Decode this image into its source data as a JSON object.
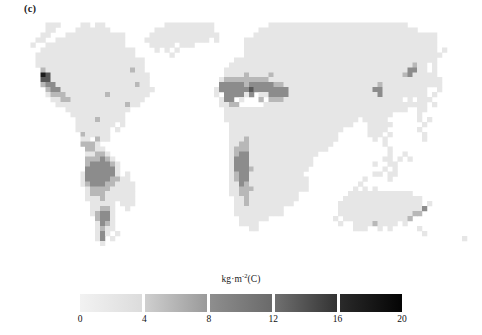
{
  "figure": {
    "panel_label": "(c)",
    "background_color": "#ffffff",
    "type": "global-gridded-map"
  },
  "legend": {
    "title_main": "kg·m",
    "title_exponent": "-2",
    "title_suffix": "(C)",
    "title_plain": "kg·m-2(C)",
    "ticks": [
      "0",
      "4",
      "8",
      "12",
      "16",
      "20"
    ],
    "segment_colors": [
      [
        "#f2f2f2",
        "#dcdcdc"
      ],
      [
        "#cfcfcf",
        "#9a9a9a"
      ],
      [
        "#8e8e8e",
        "#6a6a6a"
      ],
      [
        "#707070",
        "#333333"
      ],
      [
        "#2a2a2a",
        "#040404"
      ]
    ],
    "vmin": 0,
    "vmax": 20,
    "n_segments": 5
  },
  "chart_data": {
    "type": "heatmap",
    "title": "",
    "subtitle": "",
    "xlabel": "",
    "ylabel": "",
    "grid": false,
    "legend_position": "bottom",
    "colorbar_label": "kg·m-2(C)",
    "colorbar_ticks": [
      0,
      4,
      8,
      12,
      16,
      20
    ],
    "zmin": 0,
    "zmax": 20,
    "projection": "equirectangular",
    "x_range_deg": [
      -180,
      180
    ],
    "y_range_deg": [
      -60,
      84
    ],
    "ncols": 90,
    "nrows": 46,
    "colormap": "grayscale-reversed-5-step",
    "nodata_color": "#ffffff",
    "value_units": "kg m^-2 carbon",
    "row_latitudes": [
      84,
      81,
      78,
      75,
      72,
      69,
      66,
      63,
      60,
      57,
      54,
      51,
      48,
      45,
      42,
      39,
      36,
      33,
      30,
      27,
      24,
      21,
      18,
      15,
      12,
      9,
      6,
      3,
      0,
      -3,
      -6,
      -9,
      -12,
      -15,
      -18,
      -21,
      -24,
      -27,
      -30,
      -33,
      -36,
      -39,
      -42,
      -45,
      -48,
      -51
    ],
    "col_longitudes_start": -180,
    "col_longitude_step": 4,
    "legend_bins": [
      {
        "range": [
          0,
          4
        ],
        "label": "0-4"
      },
      {
        "range": [
          4,
          8
        ],
        "label": "4-8"
      },
      {
        "range": [
          8,
          12
        ],
        "label": "8-12"
      },
      {
        "range": [
          12,
          16
        ],
        "label": "12-16"
      },
      {
        "range": [
          16,
          20
        ],
        "label": "16-20"
      }
    ],
    "rows": [
      "..........................................................................................",
      "....111....11.11............1111111111...........1111111111111111111111111111.............",
      "....11....1111111.........111111111111.........11111111111111111111111111111111..........",
      "...11...111111111111.....11111111111111.......1111111111111111111111111111111111111......",
      "..11..11111111111111....1111111111111.1.....111111111111111111111111111111111111111......",
      ".1..1111111111111111.....11111.111..........111111111111111111111111111111111111111......",
      "...1111111111111111111....1.1.1.............111111111111111111111111111111111111111.1....",
      "..11111111111111111111.......1..............1111111111111111111111111111111111111111.....",
      "..1111111111111111111111..................11111111111111111111111111111111111111111......",
      "..1111111111111111111111.................1111111111111111111111111111111111111211.1......",
      "...211111111111111111211................11111111111111111111111111111111111113311.1......",
      "...5411111111111111111111...............1111211112111111111111111111111111112311111......",
      "...4411111111111111111111..............122222222211111111111111111111111111111111111.....",
      "...2331111111111111111211..............333332333332211111111111111111112111111111111.....",
      "....2331111111111111111111............1333333433333331111111111111111133111111111..1.....",
      "....122211111111211111111.............1.333313.1133331111111111111111113111111111.1......",
      ".....1122111111111111111...............133.1...2.222111111111111111111111111.1.111.......",
      "......11111111111111211................1122.....111111111111111111111111111111111.1......",
      "........1111111111111...................1111111111111111111111111111111111111..11........",
      ".........11111111111....................1111111111111111111111111111111111.....1.........",
      "..........1111211111....................111111111111111111111111111.11111......1.1.......",
      "..........11111111.1.....................1111111111111111111111111...11111......1........",
      "..........1111111.1......................11111111111111111111111.....1111......1.........",
      "...........211111........................1111111111111111111111......111.1......1........",
      "...........11.211........................1112111111111111111111.......1.1.......1........",
      "...........2221..........................112211111111111111111..........1................",
      "............2211.........................12221111111111111111............1...............",
      "............11221........................123311111111111111..............1..1............",
      "............222321.......................13331111111111111..............11.1.1...........",
      "............2333321......................13331111111111111............1..11..............",
      "............3333331......................1333211111111111...............1.1..............",
      "...........13333331.1....................123311111111111..............11.11..............",
      "...........1333332211....................1233111111111111...........1....1...............",
      "...........12333221111...................1132111111111111..........1.....................",
      "............1222211111...................1122211111111111.........1.1.1..................",
      "............1222111111...................11221111111111..........1111111111111...........",
      "............1112111111....................1121111111111.........1111111111111111.........",
      ".............11111.111....................112111111111.........11111111111111111.1.......",
      ".............11221..1.....................1111111111...........111111111111111113........",
      ".............12331........................1111111111...........11111111111111122.........",
      "..............2331.........................111111.............1.11111111111112...........",
      "..............1321.........................1111................1..111121111.1............",
      "..............1211...........................11...................111..1.1.....1.........",
      "..............131.1.............................................................1........",
      "..............13.1......................................................................1.",
      "...............1.........................................................................."
    ],
    "value_per_level": {
      "1": 2,
      "2": 6,
      "3": 10,
      "4": 14,
      "5": 18
    },
    "level_colors": {
      "0": "#ffffff",
      "1": "#e6e6e6",
      "2": "#b8b8b8",
      "3": "#8c8c8c",
      "4": "#575757",
      "5": "#1c1c1c"
    }
  }
}
